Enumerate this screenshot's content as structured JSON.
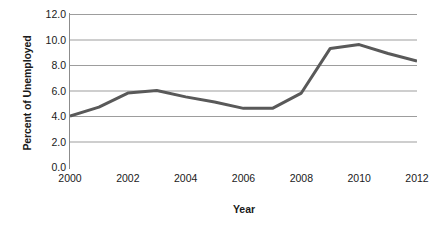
{
  "chart_data": {
    "type": "line",
    "title": "",
    "xlabel": "Year",
    "ylabel": "Percent of Unemployed",
    "x": [
      2000,
      2001,
      2002,
      2003,
      2004,
      2005,
      2006,
      2007,
      2008,
      2009,
      2010,
      2011,
      2012
    ],
    "values": [
      4.0,
      4.7,
      5.8,
      6.0,
      5.5,
      5.1,
      4.6,
      4.6,
      5.8,
      9.3,
      9.6,
      8.9,
      8.3
    ],
    "series": [
      {
        "name": "Percent of Unemployed",
        "values": [
          4.0,
          4.7,
          5.8,
          6.0,
          5.5,
          5.1,
          4.6,
          4.6,
          5.8,
          9.3,
          9.6,
          8.9,
          8.3
        ]
      }
    ],
    "xlim": [
      2000,
      2012
    ],
    "ylim": [
      0.0,
      12.0
    ],
    "x_tick_labels": [
      "2000",
      "2002",
      "2004",
      "2006",
      "2008",
      "2010",
      "2012"
    ],
    "x_tick_values": [
      2000,
      2002,
      2004,
      2006,
      2008,
      2010,
      2012
    ],
    "y_tick_labels": [
      "0.0",
      "2.0",
      "4.0",
      "6.0",
      "8.0",
      "10.0",
      "12.0"
    ],
    "y_tick_values": [
      0.0,
      2.0,
      4.0,
      6.0,
      8.0,
      10.0,
      12.0
    ],
    "grid": "horizontal",
    "legend": "none",
    "colors": {
      "line": "#595959",
      "grid": "#9d9d9d",
      "axis": "#8c8c8c",
      "text": "#1a1a1a",
      "background": "#ffffff"
    },
    "line_width": 3,
    "markers": "none"
  }
}
